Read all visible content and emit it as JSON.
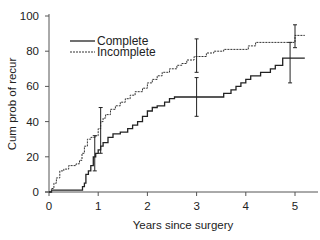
{
  "chart_data": {
    "type": "line",
    "step": true,
    "title": "",
    "xlabel": "Years since surgery",
    "ylabel": "Cum prob of recur",
    "xlim": [
      0,
      5.4
    ],
    "ylim": [
      0,
      100
    ],
    "xticks": [
      0,
      1,
      2,
      3,
      4,
      5
    ],
    "yticks": [
      0,
      20,
      40,
      60,
      80,
      100
    ],
    "grid": false,
    "legend_position": "upper-left",
    "series": [
      {
        "name": "Complete",
        "style": "solid",
        "color": "#222222",
        "points": [
          [
            0,
            0
          ],
          [
            0.05,
            1
          ],
          [
            0.65,
            1
          ],
          [
            0.68,
            3
          ],
          [
            0.72,
            5
          ],
          [
            0.75,
            10
          ],
          [
            0.8,
            12
          ],
          [
            0.85,
            15
          ],
          [
            0.9,
            20
          ],
          [
            0.95,
            22
          ],
          [
            1.0,
            24
          ],
          [
            1.05,
            26
          ],
          [
            1.1,
            28
          ],
          [
            1.2,
            31
          ],
          [
            1.3,
            33
          ],
          [
            1.45,
            34
          ],
          [
            1.6,
            36
          ],
          [
            1.7,
            38
          ],
          [
            1.8,
            40
          ],
          [
            1.9,
            43
          ],
          [
            2.0,
            46
          ],
          [
            2.1,
            48
          ],
          [
            2.2,
            49
          ],
          [
            2.35,
            51
          ],
          [
            2.45,
            53
          ],
          [
            2.55,
            54
          ],
          [
            3.5,
            54
          ],
          [
            3.55,
            56
          ],
          [
            3.7,
            58
          ],
          [
            3.8,
            60
          ],
          [
            3.9,
            62
          ],
          [
            4.0,
            64
          ],
          [
            4.1,
            66
          ],
          [
            4.3,
            68
          ],
          [
            4.5,
            70
          ],
          [
            4.6,
            72
          ],
          [
            4.75,
            76
          ],
          [
            5.2,
            76
          ]
        ],
        "error_bars": [
          {
            "x": 0.93,
            "y": 22,
            "low": 12,
            "high": 32
          },
          {
            "x": 3.0,
            "y": 54,
            "low": 43,
            "high": 65
          },
          {
            "x": 4.9,
            "y": 76,
            "low": 62,
            "high": 85
          }
        ]
      },
      {
        "name": "Incomplete",
        "style": "dashed",
        "color": "#333333",
        "points": [
          [
            0,
            0
          ],
          [
            0.05,
            2
          ],
          [
            0.1,
            5
          ],
          [
            0.15,
            8
          ],
          [
            0.22,
            12
          ],
          [
            0.3,
            13
          ],
          [
            0.4,
            15
          ],
          [
            0.55,
            16
          ],
          [
            0.62,
            18
          ],
          [
            0.67,
            22
          ],
          [
            0.72,
            26
          ],
          [
            0.78,
            30
          ],
          [
            0.85,
            31
          ],
          [
            0.95,
            32
          ],
          [
            1.0,
            36
          ],
          [
            1.05,
            40
          ],
          [
            1.1,
            42
          ],
          [
            1.15,
            44
          ],
          [
            1.25,
            47
          ],
          [
            1.35,
            49
          ],
          [
            1.45,
            51
          ],
          [
            1.55,
            53
          ],
          [
            1.65,
            55
          ],
          [
            1.75,
            57
          ],
          [
            1.9,
            59
          ],
          [
            2.0,
            62
          ],
          [
            2.1,
            64
          ],
          [
            2.2,
            66
          ],
          [
            2.3,
            68
          ],
          [
            2.45,
            70
          ],
          [
            2.6,
            72
          ],
          [
            2.7,
            73
          ],
          [
            2.8,
            75
          ],
          [
            2.95,
            77
          ],
          [
            3.1,
            77
          ],
          [
            3.2,
            79
          ],
          [
            3.35,
            80
          ],
          [
            3.55,
            81
          ],
          [
            4.0,
            81
          ],
          [
            4.05,
            83
          ],
          [
            4.2,
            85
          ],
          [
            4.95,
            85
          ],
          [
            5.0,
            89
          ],
          [
            5.2,
            89
          ]
        ],
        "error_bars": [
          {
            "x": 1.05,
            "y": 40,
            "low": 22,
            "high": 48
          },
          {
            "x": 3.0,
            "y": 77,
            "low": 68,
            "high": 87
          },
          {
            "x": 5.0,
            "y": 89,
            "low": 82,
            "high": 95
          }
        ]
      }
    ]
  },
  "labels": {
    "xlabel": "Years since surgery",
    "ylabel": "Cum prob of recur",
    "legend_complete": "Complete",
    "legend_incomplete": "Incomplete",
    "xtick_labels": [
      "0",
      "1",
      "2",
      "3",
      "4",
      "5"
    ],
    "ytick_labels": [
      "0",
      "20",
      "40",
      "60",
      "80",
      "100"
    ]
  }
}
